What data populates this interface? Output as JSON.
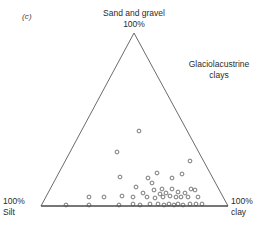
{
  "figure": {
    "panel_label": "(c)",
    "apex_label_line1": "Sand and gravel",
    "apex_label_line2": "100%",
    "annotation_line1": "Glaciolacustrine",
    "annotation_line2": "clays",
    "left_corner_line1": "100%",
    "left_corner_line2": "Silt",
    "right_corner_line1": "100%",
    "right_corner_line2": "clay",
    "line_color": "#5a5a5a",
    "marker_color": "#555555",
    "background_color": "#ffffff"
  },
  "chart_data": {
    "type": "scatter",
    "plot_style": "ternary",
    "title": "Sand and gravel 100%",
    "annotations": [
      "Glaciolacustrine clays",
      "(c)"
    ],
    "axes": [
      {
        "name": "Sand and gravel",
        "vertex": "top",
        "max_label": "100%"
      },
      {
        "name": "Silt",
        "vertex": "bottom-left",
        "max_label": "100%"
      },
      {
        "name": "Clay",
        "vertex": "bottom-right",
        "max_label": "100%"
      }
    ],
    "grid": false,
    "legend": "none",
    "marker": "open-circle",
    "vertices_px": {
      "top": [
        134,
        33
      ],
      "bottom_left": [
        41,
        206
      ],
      "bottom_right": [
        228,
        206
      ]
    },
    "note": "points_px are pixel coordinates of each sample marker; sand_silt_clay are the corresponding ternary fractions in percent",
    "points_px": [
      [
        139,
        131
      ],
      [
        117,
        152
      ],
      [
        190,
        161
      ],
      [
        157,
        173
      ],
      [
        120,
        177
      ],
      [
        182,
        174
      ],
      [
        148,
        178
      ],
      [
        152,
        183
      ],
      [
        172,
        178
      ],
      [
        136,
        187
      ],
      [
        191,
        189
      ],
      [
        154,
        190
      ],
      [
        162,
        189
      ],
      [
        172,
        189
      ],
      [
        143,
        193
      ],
      [
        160,
        194
      ],
      [
        166,
        193
      ],
      [
        178,
        192
      ],
      [
        185,
        193
      ],
      [
        195,
        190
      ],
      [
        89,
        197
      ],
      [
        104,
        197
      ],
      [
        122,
        196
      ],
      [
        133,
        197
      ],
      [
        147,
        197
      ],
      [
        155,
        198
      ],
      [
        163,
        197
      ],
      [
        170,
        196
      ],
      [
        176,
        197
      ],
      [
        181,
        197
      ],
      [
        188,
        197
      ],
      [
        198,
        197
      ],
      [
        66,
        205
      ],
      [
        89,
        205
      ],
      [
        119,
        205
      ],
      [
        133,
        204
      ],
      [
        140,
        205
      ],
      [
        150,
        204
      ],
      [
        158,
        204
      ],
      [
        164,
        205
      ],
      [
        169,
        204
      ],
      [
        174,
        205
      ],
      [
        178,
        204
      ],
      [
        183,
        205
      ],
      [
        190,
        204
      ],
      [
        196,
        204
      ],
      [
        202,
        204
      ]
    ],
    "sand_silt_clay": [
      [
        56,
        28,
        16
      ],
      [
        44,
        48,
        8
      ],
      [
        26,
        10,
        64
      ],
      [
        19,
        30,
        51
      ],
      [
        17,
        56,
        27
      ],
      [
        18,
        18,
        64
      ],
      [
        16,
        37,
        47
      ],
      [
        13,
        33,
        54
      ],
      [
        16,
        19,
        65
      ],
      [
        11,
        45,
        44
      ],
      [
        10,
        10,
        80
      ],
      [
        9,
        32,
        59
      ],
      [
        10,
        25,
        65
      ],
      [
        10,
        14,
        76
      ],
      [
        8,
        39,
        53
      ],
      [
        7,
        27,
        66
      ],
      [
        8,
        22,
        70
      ],
      [
        8,
        14,
        78
      ],
      [
        8,
        10,
        82
      ],
      [
        9,
        6,
        85
      ],
      [
        5,
        75,
        20
      ],
      [
        5,
        67,
        28
      ],
      [
        6,
        57,
        37
      ],
      [
        5,
        51,
        44
      ],
      [
        5,
        43,
        52
      ],
      [
        5,
        38,
        57
      ],
      [
        5,
        34,
        61
      ],
      [
        6,
        30,
        64
      ],
      [
        5,
        26,
        69
      ],
      [
        5,
        24,
        71
      ],
      [
        5,
        20,
        75
      ],
      [
        5,
        14,
        81
      ],
      [
        1,
        87,
        12
      ],
      [
        1,
        74,
        25
      ],
      [
        1,
        58,
        41
      ],
      [
        1,
        51,
        48
      ],
      [
        1,
        47,
        52
      ],
      [
        1,
        41,
        58
      ],
      [
        1,
        37,
        62
      ],
      [
        1,
        34,
        65
      ],
      [
        1,
        31,
        68
      ],
      [
        1,
        28,
        71
      ],
      [
        1,
        26,
        73
      ],
      [
        1,
        23,
        76
      ],
      [
        1,
        19,
        80
      ],
      [
        1,
        16,
        83
      ],
      [
        1,
        13,
        86
      ]
    ]
  }
}
